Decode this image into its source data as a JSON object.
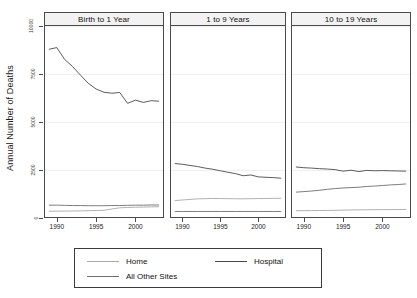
{
  "chart_data": {
    "type": "line",
    "title": "",
    "xlabel": "",
    "ylabel": "Annual Number of Deaths",
    "ylim": [
      0,
      10000
    ],
    "xlim": [
      1988.5,
      2003.5
    ],
    "grid": true,
    "legend_position": "bottom",
    "yticks": [
      0,
      2500,
      5000,
      7500,
      10000
    ],
    "ytick_labels": [
      "0",
      "2500",
      "5000",
      "7500",
      "10000"
    ],
    "xticks": [
      1990,
      1995,
      2000
    ],
    "xtick_labels": [
      "1990",
      "1995",
      "2000"
    ],
    "x": [
      1989,
      1990,
      1991,
      1992,
      1993,
      1994,
      1995,
      1996,
      1997,
      1998,
      1999,
      2000,
      2001,
      2002,
      2003
    ],
    "legend": [
      {
        "name": "Home",
        "color": "#a8a8a8"
      },
      {
        "name": "Hospital",
        "color": "#4a4a4a"
      },
      {
        "name": "All Other Sites",
        "color": "#6e6e6e"
      }
    ],
    "panels": [
      {
        "title": "Birth to 1 Year",
        "series": [
          {
            "name": "Hospital",
            "color": "#4a4a4a",
            "values": [
              8780,
              8870,
              8250,
              7880,
              7430,
              7000,
              6700,
              6530,
              6480,
              6520,
              5950,
              6120,
              6000,
              6090,
              6060
            ]
          },
          {
            "name": "All Other Sites",
            "color": "#6e6e6e",
            "values": [
              620,
              620,
              610,
              600,
              600,
              590,
              590,
              590,
              600,
              600,
              610,
              620,
              620,
              630,
              630
            ]
          },
          {
            "name": "Home",
            "color": "#a8a8a8",
            "values": [
              300,
              305,
              310,
              315,
              320,
              330,
              340,
              350,
              420,
              480,
              500,
              510,
              520,
              530,
              540
            ]
          }
        ]
      },
      {
        "title": "1 to 9 Years",
        "series": [
          {
            "name": "Hospital",
            "color": "#4a4a4a",
            "values": [
              2800,
              2760,
              2700,
              2640,
              2560,
              2500,
              2420,
              2340,
              2270,
              2160,
              2200,
              2100,
              2080,
              2060,
              2030
            ]
          },
          {
            "name": "Home",
            "color": "#a8a8a8",
            "values": [
              860,
              890,
              920,
              950,
              960,
              970,
              965,
              960,
              955,
              950,
              960,
              965,
              970,
              975,
              980
            ]
          },
          {
            "name": "All Other Sites",
            "color": "#6e6e6e",
            "values": [
              290,
              290,
              290,
              290,
              290,
              290,
              290,
              290,
              290,
              290,
              290,
              290,
              290,
              290,
              290
            ]
          }
        ]
      },
      {
        "title": "10 to 19 Years",
        "series": [
          {
            "name": "Hospital",
            "color": "#4a4a4a",
            "values": [
              2620,
              2580,
              2560,
              2530,
              2510,
              2480,
              2400,
              2450,
              2380,
              2440,
              2420,
              2430,
              2420,
              2410,
              2400
            ]
          },
          {
            "name": "All Other Sites",
            "color": "#6e6e6e",
            "values": [
              1300,
              1330,
              1360,
              1400,
              1450,
              1490,
              1520,
              1540,
              1560,
              1600,
              1620,
              1650,
              1680,
              1700,
              1730
            ]
          },
          {
            "name": "Home",
            "color": "#a8a8a8",
            "values": [
              330,
              330,
              335,
              340,
              345,
              350,
              360,
              370,
              375,
              380,
              385,
              385,
              390,
              390,
              395
            ]
          }
        ]
      }
    ]
  }
}
